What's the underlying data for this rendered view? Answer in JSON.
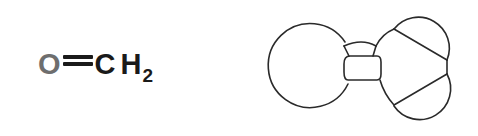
{
  "formula": {
    "atoms": [
      "O",
      "C",
      "H"
    ],
    "subscript": "2",
    "bond": "double",
    "colors": {
      "oxygen": "#6e6e6e",
      "carbon": "#1a1a1a",
      "hydrogen": "#1a1a1a"
    }
  },
  "model": {
    "type": "space-filling-outline",
    "molecule": "formaldehyde",
    "stroke": "#2a2a2a"
  }
}
